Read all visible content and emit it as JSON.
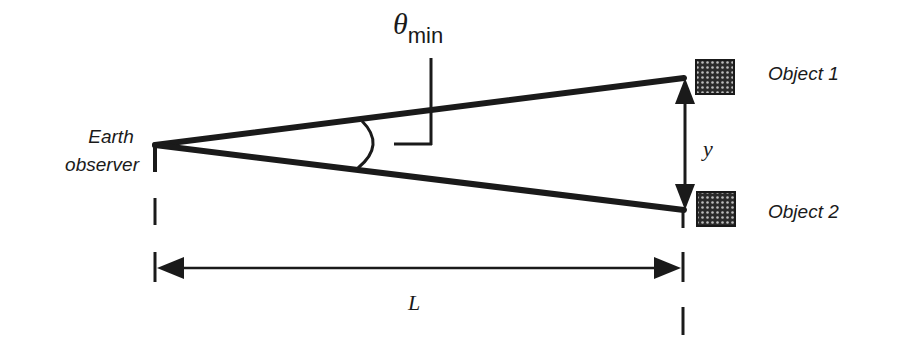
{
  "diagram": {
    "type": "angular-resolution-geometry",
    "labels": {
      "theta_symbol": "θ",
      "theta_subscript": "min",
      "observer_line1": "Earth",
      "observer_line2": "observer",
      "object1": "Object 1",
      "object2": "Object 2",
      "separation": "y",
      "distance": "L"
    },
    "colors": {
      "stroke": "#1a1a1a",
      "background": "#ffffff",
      "object_fill": "#2b2b2b",
      "object_dots": "#bdbdbd"
    }
  }
}
